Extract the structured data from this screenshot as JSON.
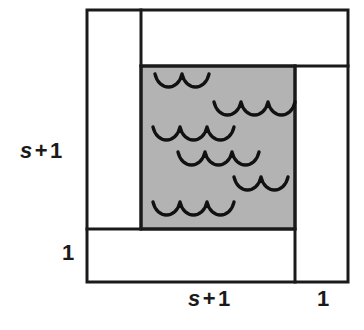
{
  "figure": {
    "kind": "geometric-area-diagram",
    "colors": {
      "background": "#ffffff",
      "stroke": "#1a1a1a",
      "shaded_fill": "#b3b3b3",
      "label_text": "#1a1a1a"
    },
    "outer_square": {
      "x": 87,
      "y": 10,
      "width": 261,
      "height": 272,
      "stroke_width": 3
    },
    "shaded_rect": {
      "x": 141,
      "y": 66,
      "width": 154,
      "height": 163,
      "stroke_width": 3,
      "fill": "#b3b3b3"
    },
    "dividers": [
      {
        "name": "vertical-left-strip",
        "x1": 141,
        "y1": 10,
        "x2": 141,
        "y2": 229
      },
      {
        "name": "horizontal-bottom-strip",
        "x1": 87,
        "y1": 229,
        "x2": 295,
        "y2": 229
      },
      {
        "name": "horizontal-top-strip",
        "x1": 141,
        "y1": 66,
        "x2": 348,
        "y2": 66
      },
      {
        "name": "vertical-right-strip",
        "x1": 295,
        "y1": 66,
        "x2": 295,
        "y2": 282
      }
    ],
    "wave_groups": [
      {
        "id": 1,
        "arcs": 2,
        "x": 155,
        "y": 74,
        "arc_width": 27,
        "arc_depth": 13
      },
      {
        "id": 2,
        "arcs": 3,
        "x": 214,
        "y": 102,
        "arc_width": 27,
        "arc_depth": 13
      },
      {
        "id": 3,
        "arcs": 3,
        "x": 153,
        "y": 127,
        "arc_width": 27,
        "arc_depth": 13
      },
      {
        "id": 4,
        "arcs": 3,
        "x": 178,
        "y": 152,
        "arc_width": 27,
        "arc_depth": 13
      },
      {
        "id": 5,
        "arcs": 2,
        "x": 234,
        "y": 177,
        "arc_width": 27,
        "arc_depth": 13
      },
      {
        "id": 6,
        "arcs": 3,
        "x": 153,
        "y": 202,
        "arc_width": 27,
        "arc_depth": 13
      }
    ]
  },
  "labels": {
    "left_height": {
      "variable": "s",
      "operator": "+",
      "number": "1",
      "full_text": "s + 1"
    },
    "left_unit": {
      "number": "1",
      "full_text": "1"
    },
    "bottom_width": {
      "variable": "s",
      "operator": "+",
      "number": "1",
      "full_text": "s + 1"
    },
    "bottom_unit": {
      "number": "1",
      "full_text": "1"
    }
  }
}
